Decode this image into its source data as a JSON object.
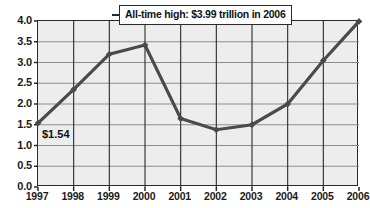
{
  "chart_data": {
    "type": "line",
    "title": "",
    "xlabel": "",
    "ylabel": "",
    "categories": [
      "1997",
      "1998",
      "1999",
      "2000",
      "2001",
      "2002",
      "2003",
      "2004",
      "2005",
      "2006"
    ],
    "values": [
      1.54,
      2.35,
      3.2,
      3.42,
      1.65,
      1.38,
      1.5,
      2.0,
      3.05,
      3.99
    ],
    "ylim": [
      0.0,
      4.0
    ],
    "y_ticks": [
      "0.0",
      "0.5",
      "1.0",
      "1.5",
      "2.0",
      "2.5",
      "3.0",
      "3.5",
      "4.0"
    ],
    "y_tick_values": [
      0.0,
      0.5,
      1.0,
      1.5,
      2.0,
      2.5,
      3.0,
      3.5,
      4.0
    ],
    "grid": true,
    "legend": "none",
    "series_color": "#4a4a4a",
    "plot_background": "#ededed",
    "axis_color": "#2b2b2b",
    "grid_color": "#8d8d8d",
    "annotations": [
      {
        "name": "all-time-high-callout",
        "text": "All-time high: $3.99 trillion in 2006"
      },
      {
        "name": "first-point-value",
        "text": "$1.54"
      }
    ]
  }
}
